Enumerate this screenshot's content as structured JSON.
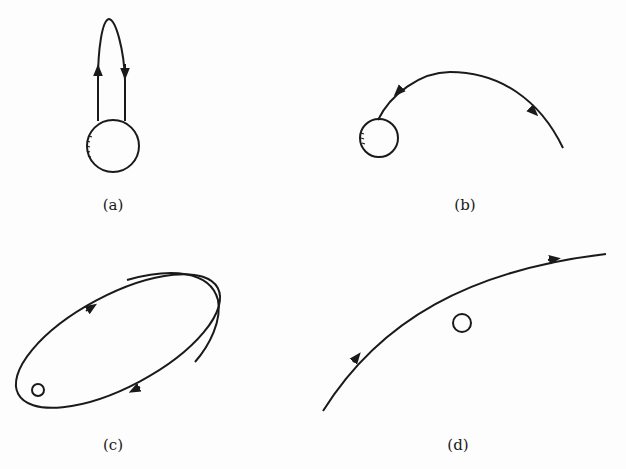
{
  "figure": {
    "panels": [
      {
        "id": "a",
        "label": "(a)",
        "description": "Ballistic trajectory launched vertically, returning to the body"
      },
      {
        "id": "b",
        "label": "(b)",
        "description": "Escape trajectory from body along a curved path"
      },
      {
        "id": "c",
        "label": "(c)",
        "description": "Elliptical orbit around small body with precession"
      },
      {
        "id": "d",
        "label": "(d)",
        "description": "Hyperbolic flyby past a small body"
      }
    ],
    "colors": {
      "stroke": "#1a1a1a",
      "background": "#fdfdfd"
    }
  }
}
